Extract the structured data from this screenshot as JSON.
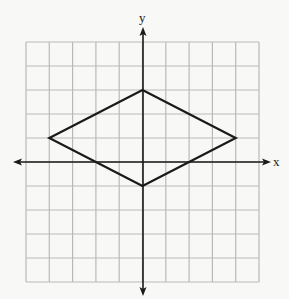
{
  "figure": {
    "x_axis_label": "x",
    "y_axis_label": "y",
    "grid": {
      "x_min": -5,
      "x_max": 5,
      "y_min": -5,
      "y_max": 5,
      "step": 1,
      "columns": 10,
      "rows": 10
    },
    "shape": {
      "type": "rhombus",
      "vertices": [
        {
          "x": 0,
          "y": 3
        },
        {
          "x": 4,
          "y": 1
        },
        {
          "x": 0,
          "y": -1
        },
        {
          "x": -4,
          "y": 1
        }
      ]
    },
    "colors": {
      "background": "#f8f8f6",
      "grid_line": "#b9b9b9",
      "axis": "#1a1a1a",
      "shape_stroke": "#1a1a1a"
    }
  }
}
